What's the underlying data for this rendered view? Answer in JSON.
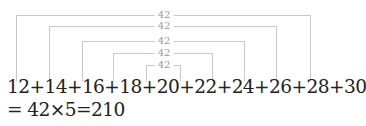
{
  "pairs": [
    {
      "left": 12,
      "right": 30,
      "sum_label": "42"
    },
    {
      "left": 14,
      "right": 28,
      "sum_label": "42"
    },
    {
      "left": 16,
      "right": 26,
      "sum_label": "42"
    },
    {
      "left": 18,
      "right": 24,
      "sum_label": "42"
    },
    {
      "left": 20,
      "right": 22,
      "sum_label": "42"
    }
  ],
  "equation_line_1": "12+14+16+18+20+22+24+26+28+30",
  "equation_line_2": "= 42×5=210",
  "colors": {
    "text": "#222222",
    "bracket": "#c8c8c8",
    "label": "#9a9a9a"
  }
}
